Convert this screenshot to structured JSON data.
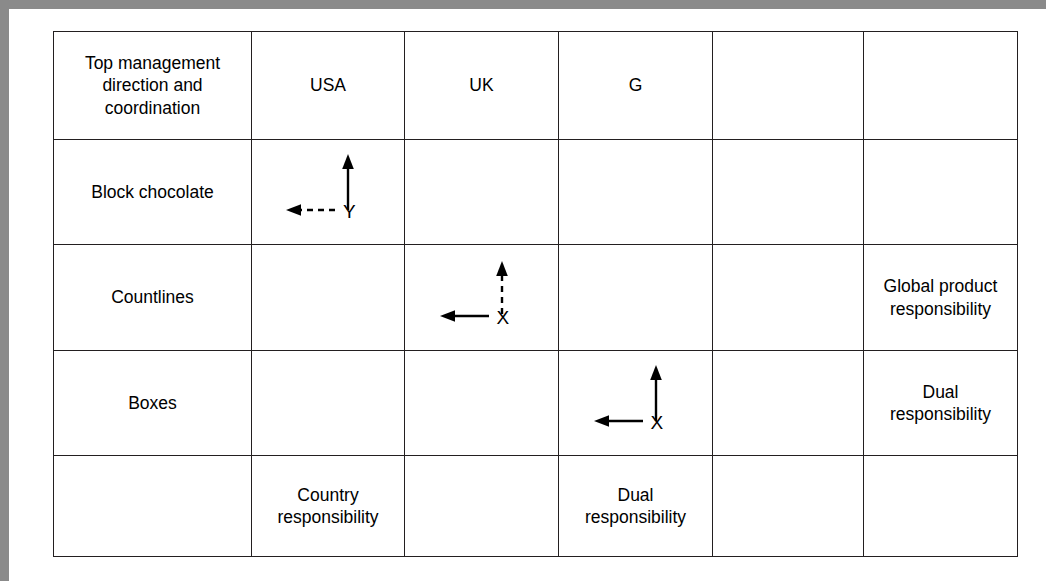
{
  "figure": {
    "type": "matrix-table",
    "columns": 6,
    "rows": 5
  },
  "table": {
    "header": {
      "row_label": "Top management\ndirection and\ncoordination",
      "cells": [
        "Top management direction and coordination",
        "USA",
        "UK",
        "G",
        "",
        ""
      ]
    },
    "rows": [
      {
        "label": "Block chocolate",
        "cells": [
          {
            "kind": "arrow",
            "column": 1,
            "label": "Y",
            "vertical": "solid",
            "horizontal": "dashed"
          },
          {
            "kind": "empty",
            "column": 2
          },
          {
            "kind": "empty",
            "column": 3
          },
          {
            "kind": "empty",
            "column": 4
          },
          {
            "kind": "empty",
            "column": 5
          }
        ]
      },
      {
        "label": "Countlines",
        "cells": [
          {
            "kind": "empty",
            "column": 1
          },
          {
            "kind": "arrow",
            "column": 2,
            "label": "X",
            "vertical": "dashed",
            "horizontal": "solid"
          },
          {
            "kind": "empty",
            "column": 3
          },
          {
            "kind": "empty",
            "column": 4
          },
          {
            "kind": "text",
            "column": 5,
            "text": "Global product responsibility"
          }
        ]
      },
      {
        "label": "Boxes",
        "cells": [
          {
            "kind": "empty",
            "column": 1
          },
          {
            "kind": "empty",
            "column": 2
          },
          {
            "kind": "arrow",
            "column": 3,
            "label": "X",
            "vertical": "solid",
            "horizontal": "solid"
          },
          {
            "kind": "empty",
            "column": 4
          },
          {
            "kind": "text",
            "column": 5,
            "text": "Dual responsibility"
          }
        ]
      },
      {
        "label": "",
        "cells": [
          {
            "kind": "text",
            "column": 1,
            "text": "Country responsibility"
          },
          {
            "kind": "empty",
            "column": 2
          },
          {
            "kind": "text",
            "column": 3,
            "text": "Dual responsibility"
          },
          {
            "kind": "empty",
            "column": 4
          },
          {
            "kind": "empty",
            "column": 5
          }
        ]
      }
    ]
  },
  "labels": {
    "header_col0_line1": "Top management",
    "header_col0_line2": "direction and",
    "header_col0_line3": "coordination",
    "header_usa": "USA",
    "header_uk": "UK",
    "header_g": "G",
    "header_col4": "",
    "header_col5": "",
    "row_block_chocolate": "Block chocolate",
    "row_countlines": "Countlines",
    "row_boxes": "Boxes",
    "row_bottom": "",
    "global_product_responsibility": "Global product responsibility",
    "dual_responsibility_countlines_right": "Dual responsibility",
    "country_responsibility": "Country responsibility",
    "dual_responsibility_bottom": "Dual responsibility",
    "arrow_y": "Y",
    "arrow_x_countlines": "X",
    "arrow_x_boxes": "X"
  },
  "colors": {
    "frame": "#8a8a8a",
    "border": "#231f20",
    "text": "#000000",
    "background": "#ffffff"
  }
}
